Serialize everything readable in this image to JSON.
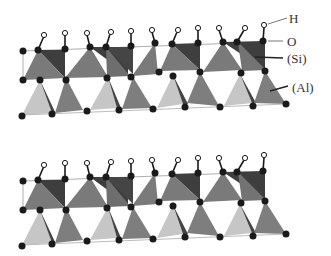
{
  "diagram": {
    "labels": {
      "h": "H",
      "o": "O",
      "si": "(Si)",
      "al": "(Al)"
    },
    "colors": {
      "si_dark": "#3f3f3f",
      "si_mid": "#7a7a7a",
      "al_light": "#c4c4c4",
      "al_mid": "#7e7e7e",
      "oxygen": "#1a1a1a",
      "hydrogen": "#ffffff"
    },
    "layers": [
      {
        "name": "upper-layer",
        "offset_y": 0
      },
      {
        "name": "lower-layer",
        "offset_y": 130
      }
    ]
  }
}
